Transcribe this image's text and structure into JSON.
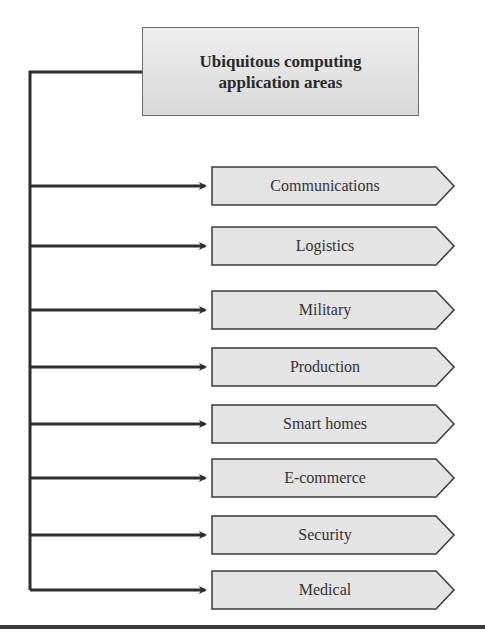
{
  "diagram": {
    "root": {
      "title": "Ubiquitous computing\napplication areas"
    },
    "items": [
      {
        "label": "Communications",
        "top": 166
      },
      {
        "label": "Logistics",
        "top": 226
      },
      {
        "label": "Military",
        "top": 286
      },
      {
        "label": "Production",
        "top": 344
      },
      {
        "label": "Smart homes",
        "top": 403
      },
      {
        "label": "E-commerce",
        "top": 458
      },
      {
        "label": "Security",
        "top": 515
      },
      {
        "label": "Medical",
        "top": 569
      }
    ],
    "colors": {
      "box_fill": "#e4e4e4",
      "box_stroke": "#3a3a3a",
      "line": "#2e2e2e",
      "text": "#333333"
    }
  }
}
